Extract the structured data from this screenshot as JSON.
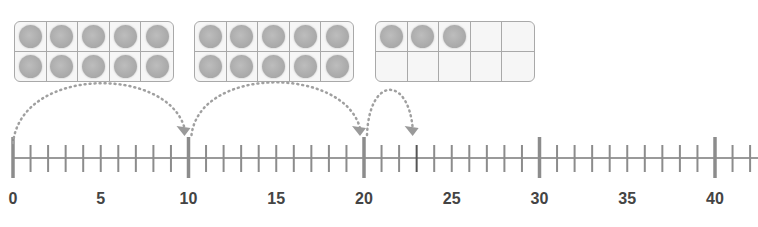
{
  "ten_frames": [
    {
      "filled": 10,
      "total": 10
    },
    {
      "filled": 10,
      "total": 10
    },
    {
      "filled": 3,
      "total": 10
    }
  ],
  "number_line": {
    "start": 0,
    "end": 42,
    "labels": [
      "0",
      "5",
      "10",
      "15",
      "20",
      "25",
      "30",
      "35",
      "40"
    ],
    "label_values": [
      0,
      5,
      10,
      15,
      20,
      25,
      30,
      35,
      40
    ],
    "major_ticks": [
      0,
      10,
      20,
      30,
      40
    ],
    "highlighted_tick": 23
  },
  "jumps": [
    {
      "from": 0,
      "to": 10
    },
    {
      "from": 10,
      "to": 20
    },
    {
      "from": 20,
      "to": 23
    }
  ],
  "colors": {
    "line": "#8c8c8c",
    "label": "#444444",
    "counter": "#aaaaaa",
    "arrow": "#a0a0a0"
  }
}
